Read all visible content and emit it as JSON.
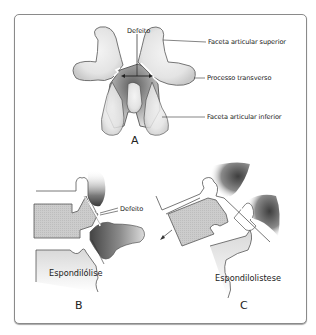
{
  "figure": {
    "panels": [
      {
        "id": "A",
        "letter": "A",
        "labels": {
          "defect": "Defeito",
          "superior_facet": "Faceta articular superior",
          "transverse_process": "Processo transverso",
          "inferior_facet": "Faceta articular inferior"
        }
      },
      {
        "id": "B",
        "letter": "B",
        "labels": {
          "defect": "Defeito",
          "caption": "Espondilólise"
        }
      },
      {
        "id": "C",
        "letter": "C",
        "labels": {
          "caption": "Espondilolistese"
        }
      }
    ],
    "colors": {
      "bone_light": "#e6e6e6",
      "bone_shade": "#5a5a5a",
      "body_fill": "#cfcfcf",
      "outline": "#444444",
      "frame": "#8a8a8a"
    }
  }
}
